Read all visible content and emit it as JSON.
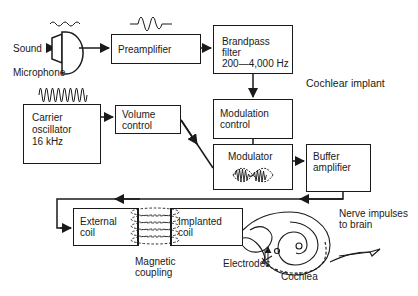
{
  "diagram": {
    "title": "Cochlear implant",
    "inputs": {
      "sound_label": "Sound",
      "microphone_label": "Microphone"
    },
    "blocks": {
      "preamplifier": "Preamplifier",
      "bandpass_filter": "Brandpass\nfilter\n200—4,000 Hz",
      "modulation_control": "Modulation\ncontrol",
      "carrier_oscillator": "Carrier\noscillator\n16 kHz",
      "volume_control": "Volume\ncontrol",
      "modulator": "Modulator",
      "buffer_amplifier": "Buffer\namplifier",
      "external_coil": "External\ncoil",
      "implanted_coil": "Implanted\ncoil"
    },
    "annotations": {
      "magnetic_coupling": "Magnetic\ncoupling",
      "electrodes": "Electrodes",
      "cochlea": "Cochlea",
      "nerve_impulses": "Nerve impulses\nto brain"
    },
    "connections": [
      {
        "from": "Sound",
        "to": "Microphone"
      },
      {
        "from": "Microphone",
        "to": "Preamplifier"
      },
      {
        "from": "Preamplifier",
        "to": "Brandpass filter"
      },
      {
        "from": "Brandpass filter",
        "to": "Modulation control"
      },
      {
        "from": "Modulation control",
        "to": "Modulator"
      },
      {
        "from": "Carrier oscillator",
        "to": "Volume control"
      },
      {
        "from": "Volume control",
        "to": "Modulator"
      },
      {
        "from": "Modulator",
        "to": "Buffer amplifier"
      },
      {
        "from": "Buffer amplifier",
        "to": "External coil"
      },
      {
        "from": "External coil",
        "to": "Implanted coil",
        "via": "Magnetic coupling"
      },
      {
        "from": "Implanted coil",
        "to": "Electrodes"
      },
      {
        "from": "Cochlea",
        "to": "Nerve impulses to brain"
      }
    ],
    "colors": {
      "ink": "#1a1a1a",
      "background": "#ffffff"
    }
  }
}
